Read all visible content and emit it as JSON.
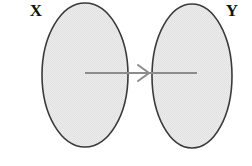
{
  "diagram": {
    "type": "set-mapping-venn",
    "canvas": {
      "width": 252,
      "height": 166,
      "background": "#ffffff"
    },
    "style": {
      "ellipse_fill": "#e8e8e8",
      "ellipse_stroke": "#3a3a3a",
      "ellipse_stroke_width": 1.6,
      "arrow_color": "#8c8c8c",
      "arrow_width": 2.0,
      "label_color": "#111111",
      "stipple_texture": true
    },
    "sets": [
      {
        "id": "set-x",
        "label": "X",
        "label_x": 36,
        "label_y": 16,
        "cx": 85,
        "cy": 75,
        "rx": 43,
        "ry": 72
      },
      {
        "id": "set-y",
        "label": "Y",
        "label_x": 232,
        "label_y": 16,
        "cx": 192,
        "cy": 76,
        "rx": 40,
        "ry": 72
      }
    ],
    "arrow": {
      "id": "mapping-arrow",
      "label": "",
      "x1": 85,
      "y1": 73,
      "x2": 197,
      "y2": 73,
      "head_x": 148,
      "head_style": "open-chevron"
    }
  }
}
